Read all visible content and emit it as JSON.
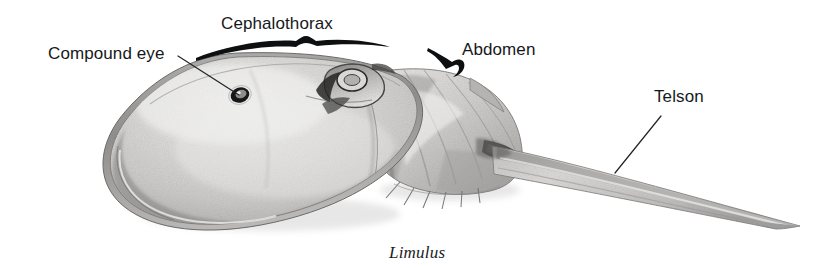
{
  "figure": {
    "title": "Limulus",
    "caption": "Limulus",
    "background_color": "#ffffff",
    "width": 833,
    "height": 268,
    "medium": "pencil-drawing"
  },
  "labels": {
    "compound_eye": "Compound eye",
    "cephalothorax": "Cephalothorax",
    "abdomen": "Abdomen",
    "telson": "Telson"
  },
  "colors": {
    "text": "#16181a",
    "leader_line": "#2a2c2e",
    "brace": "#101112",
    "shell_light": "#e8e7e6",
    "shell_mid": "#c9c8c7",
    "shell_dark": "#9a9998",
    "outline": "#6f6e6d",
    "eye": "#1c1d1f"
  },
  "annotations": [
    {
      "name": "compound-eye",
      "label": "Compound eye",
      "type": "leader-line",
      "from": [
        178,
        56
      ],
      "to": [
        239,
        95
      ]
    },
    {
      "name": "cephalothorax",
      "label": "Cephalothorax",
      "type": "brace",
      "span_x": [
        196,
        388
      ],
      "y": 45
    },
    {
      "name": "abdomen",
      "label": "Abdomen",
      "type": "brace",
      "span_x": [
        428,
        470
      ],
      "y": 52
    },
    {
      "name": "telson",
      "label": "Telson",
      "type": "leader-line",
      "from": [
        661,
        116
      ],
      "to": [
        615,
        173
      ]
    }
  ]
}
